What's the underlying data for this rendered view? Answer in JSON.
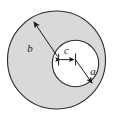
{
  "figure": {
    "type": "geometric-diagram",
    "background_color": "#ffffff",
    "annulus_fill_color": "#d9d9d9",
    "inner_fill_color": "#ffffff",
    "stroke_color": "#2b2b2b",
    "label_color": "#1a1a1a",
    "outer_circle": {
      "name": "outer-boundary-circle",
      "cx": 56.5,
      "cy": 60,
      "r": 49.5,
      "fill": "#d9d9d9",
      "stroke": "#2b2b2b"
    },
    "inner_circle": {
      "name": "inner-bore-circle",
      "cx": 75.5,
      "cy": 63.5,
      "r": 23.5,
      "fill": "#ffffff",
      "stroke": "#2b2b2b"
    },
    "labels": [
      {
        "id": "b",
        "text": "b",
        "meaning": "outer radius",
        "x": 30,
        "y": 52
      },
      {
        "id": "c",
        "text": "c",
        "meaning": "eccentricity offset",
        "x": 65,
        "y": 54
      },
      {
        "id": "a",
        "text": "a",
        "meaning": "inner radius",
        "x": 92,
        "y": 74
      }
    ],
    "leaders": [
      {
        "id": "b-radius-arrow",
        "meaning": "outer radius leader from inner-circle edge to outer circle",
        "from_x": 57,
        "from_y": 55,
        "to_x": 33,
        "to_y": 21,
        "arrow_at": "to"
      },
      {
        "id": "c-offset-arrow",
        "meaning": "horizontal double arrow showing center offset",
        "from_x": 58.5,
        "from_y": 59.5,
        "to_x": 75.5,
        "to_y": 59.5,
        "arrow_at": "both"
      },
      {
        "id": "a-radius-arrow",
        "meaning": "inner radius leader from inner-circle centre to its edge",
        "from_x": 75.5,
        "from_y": 59.5,
        "to_x": 92.5,
        "to_y": 84,
        "arrow_at": "to"
      }
    ],
    "ticks": [
      {
        "id": "c-left-tick",
        "x": 58.5,
        "y1": 54,
        "y2": 65
      },
      {
        "id": "c-right-tick",
        "x": 75.5,
        "y1": 54,
        "y2": 65
      }
    ]
  }
}
